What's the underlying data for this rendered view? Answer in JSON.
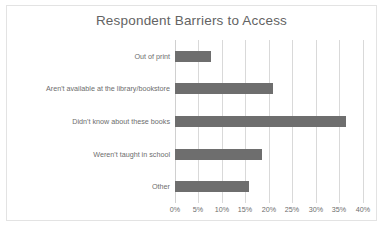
{
  "chart_data": {
    "type": "bar",
    "orientation": "horizontal",
    "title": "Respondent Barriers to Access",
    "xlabel": "",
    "ylabel": "",
    "categories": [
      "Out of print",
      "Aren't available at the library/bookstore",
      "Didn't know about these books",
      "Weren't taught in school",
      "Other"
    ],
    "values": [
      7.6,
      20.8,
      36.5,
      18.5,
      15.8
    ],
    "value_suffix": "%",
    "xlim": [
      0,
      43
    ],
    "xticks": [
      0,
      5,
      10,
      15,
      20,
      25,
      30,
      35,
      40
    ],
    "xtick_labels": [
      "0%",
      "5%",
      "10%",
      "15%",
      "20%",
      "25%",
      "30%",
      "35%",
      "40%"
    ],
    "grid": "vertical",
    "legend": null,
    "colors": {
      "bar": "#6e6e6e",
      "gridline": "#d9d9d9",
      "title_text": "#636363",
      "label_text": "#6d6d6d",
      "background": "#ffffff",
      "border": "#e3e3e3"
    }
  }
}
